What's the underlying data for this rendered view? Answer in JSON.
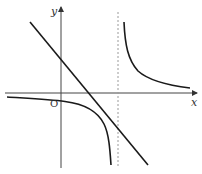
{
  "diagram": {
    "type": "function-graph",
    "axes": {
      "x_label": "x",
      "y_label": "y",
      "origin_label": "O"
    },
    "elements": [
      {
        "name": "hyperbola-left-branch",
        "description": "lower-left branch approaching x-axis from below on the left and descending to -infinity near the asymptote"
      },
      {
        "name": "hyperbola-right-branch",
        "description": "upper-right branch descending from +infinity near the asymptote toward the x-axis"
      },
      {
        "name": "vertical-asymptote",
        "style": "dashed",
        "description": "vertical dashed line right of the y-axis"
      },
      {
        "name": "straight-line",
        "description": "decreasing line crossing positive y-axis and positive x-axis"
      }
    ],
    "colors": {
      "curve": "#1a1a1a",
      "axis": "#444444",
      "asymptote": "#9a9a9a"
    }
  }
}
